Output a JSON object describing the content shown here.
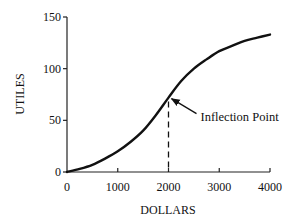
{
  "chart_data": {
    "type": "line",
    "title": "",
    "xlabel": "DOLLARS",
    "ylabel": "UTILES",
    "xlim": [
      0,
      4000
    ],
    "ylim": [
      0,
      150
    ],
    "xticks": [
      0,
      1000,
      2000,
      3000,
      4000
    ],
    "yticks": [
      0,
      50,
      100,
      150
    ],
    "xtick_labels": [
      "0",
      "1000",
      "2000",
      "3000",
      "4000"
    ],
    "ytick_labels": [
      "0",
      "50",
      "100",
      "150"
    ],
    "grid": false,
    "legend": null,
    "series": [
      {
        "name": "Utility curve",
        "color": "#111111",
        "x": [
          0,
          250,
          500,
          750,
          1000,
          1250,
          1500,
          1750,
          2000,
          2250,
          2500,
          2750,
          3000,
          3250,
          3500,
          3750,
          4000
        ],
        "y": [
          0,
          3,
          7,
          13,
          20,
          29,
          40,
          55,
          72,
          88,
          100,
          109,
          117,
          122,
          127,
          130,
          133
        ]
      }
    ],
    "annotations": [
      {
        "text": "Inflection Point",
        "point": {
          "x": 2000,
          "y": 72
        },
        "arrow": true,
        "dashed_drop_line": true
      }
    ]
  }
}
